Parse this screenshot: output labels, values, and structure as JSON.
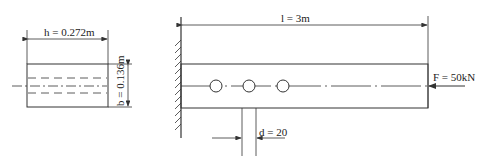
{
  "cross_section": {
    "width_label": "h = 0.272m",
    "height_label": "b = 0.136m"
  },
  "beam": {
    "length_label": "l = 3m",
    "force_label": "F = 50kN",
    "hole_diameter_label": "d = 20",
    "hole_count": 3
  },
  "colors": {
    "line": "#333333",
    "background": "#ffffff"
  }
}
